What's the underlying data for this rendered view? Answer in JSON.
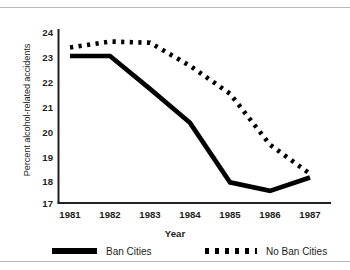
{
  "chart_data": {
    "type": "line",
    "title": "",
    "xlabel": "Year",
    "ylabel": "Percent alcohol-related accidents",
    "categories": [
      "1981",
      "1982",
      "1983",
      "1984",
      "1985",
      "1986",
      "1987"
    ],
    "x": [
      1981,
      1982,
      1983,
      1984,
      1985,
      1986,
      1987
    ],
    "xlim": [
      1981,
      1987
    ],
    "ylim": [
      17,
      24
    ],
    "yticks": [
      "17",
      "18",
      "19",
      "20",
      "21",
      "22",
      "23",
      "24"
    ],
    "grid": false,
    "legend_position": "bottom",
    "series": [
      {
        "name": "Ban Cities",
        "style": "solid",
        "color": "#000000",
        "values": [
          23.05,
          23.05,
          21.7,
          20.3,
          17.85,
          17.5,
          18.05
        ]
      },
      {
        "name": "No Ban Cities",
        "style": "dotted",
        "color": "#000000",
        "values": [
          23.4,
          23.65,
          23.6,
          22.65,
          21.5,
          19.4,
          18.2
        ]
      }
    ]
  },
  "axes": {
    "y_label": "Percent alcohol-related accidents",
    "x_label": "Year",
    "y_tick_labels": [
      "24",
      "23",
      "22",
      "21",
      "20",
      "19",
      "18",
      "17"
    ],
    "x_tick_labels": [
      "1981",
      "1982",
      "1983",
      "1984",
      "1985",
      "1986",
      "1987"
    ]
  },
  "legend": {
    "items": [
      {
        "label": "Ban Cities",
        "marker": "solid-line-swatch"
      },
      {
        "label": "No Ban Cities",
        "marker": "dotted-line-swatch"
      }
    ]
  }
}
